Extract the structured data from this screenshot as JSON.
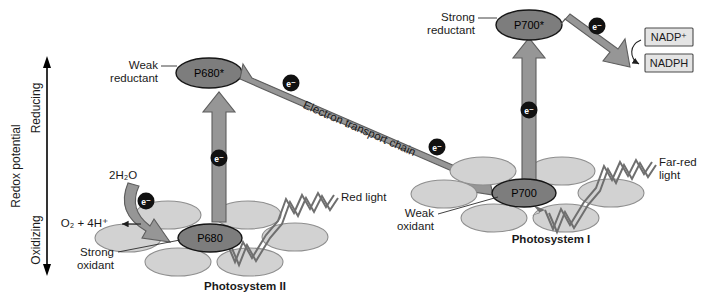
{
  "figure": {
    "axis": {
      "label": "Redox potential",
      "top_label": "Reducing",
      "bottom_label": "Oxidizing"
    },
    "photosystem_ii": {
      "name": "Photosystem II",
      "reaction_center_ground": "P680",
      "reaction_center_excited": "P680*",
      "excited_annotation": "Weak\nreductant",
      "excited_annotation_line1": "Weak",
      "excited_annotation_line2": "reductant",
      "ground_annotation_line1": "Strong",
      "ground_annotation_line2": "oxidant",
      "light_label": "Red light",
      "substrate": "2H₂O",
      "products": "O₂ + 4H⁺"
    },
    "photosystem_i": {
      "name": "Photosystem I",
      "reaction_center_ground": "P700",
      "reaction_center_excited": "P700*",
      "excited_annotation_line1": "Strong",
      "excited_annotation_line2": "reductant",
      "ground_annotation_line1": "Weak",
      "ground_annotation_line2": "oxidant",
      "light_label_line1": "Far-red",
      "light_label_line2": "light"
    },
    "electron_transport": {
      "label": "Electron transport chain",
      "carrier": "e⁻"
    },
    "acceptors": {
      "oxidized": "NADP⁺",
      "reduced": "NADPH"
    },
    "electron_badges": [
      {
        "id": "e-water-to-p680",
        "label": "e⁻"
      },
      {
        "id": "e-p680-excitation",
        "label": "e⁻"
      },
      {
        "id": "e-etc-upper",
        "label": "e⁻"
      },
      {
        "id": "e-etc-lower",
        "label": "e⁻"
      },
      {
        "id": "e-p700-excitation",
        "label": "e⁻"
      },
      {
        "id": "e-to-nadp",
        "label": "e⁻"
      }
    ],
    "colors": {
      "background": "#ffffff",
      "antenna_fill": "#d2d2d2",
      "antenna_stroke": "#8e8e8e",
      "reaction_center_fill": "#7d7d7d",
      "arrow_fill": "#969696",
      "arrow_stroke": "#5d5d5d",
      "text": "#1a1a1a",
      "badge_fill": "#111111",
      "box_fill": "#e4e4e4",
      "zigzag_stroke": "#6f6f6f"
    }
  }
}
